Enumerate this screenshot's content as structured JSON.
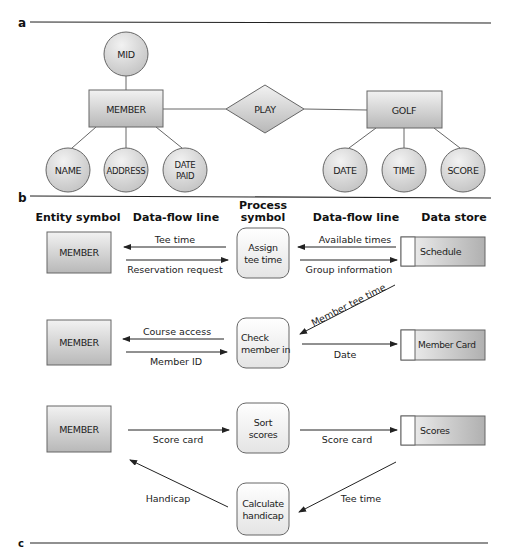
{
  "sections": {
    "a": "a",
    "b": "b",
    "c": "c"
  },
  "er_diagram": {
    "entities": {
      "member": "MEMBER",
      "golf": "GOLF"
    },
    "relationship": "PLAY",
    "attributes": {
      "mid": "MID",
      "name": "NAME",
      "address": "ADDRESS",
      "date_paid_line1": "DATE",
      "date_paid_line2": "PAID",
      "date": "DATE",
      "time": "TIME",
      "score": "SCORE"
    }
  },
  "dfd": {
    "headers": {
      "entity_symbol": "Entity symbol",
      "data_flow_line_left": "Data-flow line",
      "process_symbol_line1": "Process",
      "process_symbol_line2": "symbol",
      "data_flow_line_right": "Data-flow line",
      "data_store": "Data store"
    },
    "rows": [
      {
        "entity": "MEMBER",
        "flow_left_top": "Tee time",
        "flow_left_bottom": "Reservation request",
        "process_line1": "Assign",
        "process_line2": "tee time",
        "flow_right_top": "Available times",
        "flow_right_bottom": "Group information",
        "store": "Schedule"
      },
      {
        "entity": "MEMBER",
        "flow_left_top": "Course access",
        "flow_left_bottom": "Member ID",
        "process_line1": "Check",
        "process_line2": "member in",
        "flow_right": "Date",
        "flow_diagonal": "Member tee time",
        "store": "Member Card"
      },
      {
        "entity": "MEMBER",
        "flow_left": "Score card",
        "process_line1": "Sort",
        "process_line2": "scores",
        "flow_right": "Score card",
        "store": "Scores"
      }
    ],
    "calculate": {
      "process_line1": "Calculate",
      "process_line2": "handicap",
      "flow_left": "Handicap",
      "flow_right": "Tee time"
    }
  },
  "colors": {
    "shape_light": "#eeeeee",
    "shape_dark": "#b5b5b5",
    "stroke": "#555555",
    "line": "#222222"
  }
}
